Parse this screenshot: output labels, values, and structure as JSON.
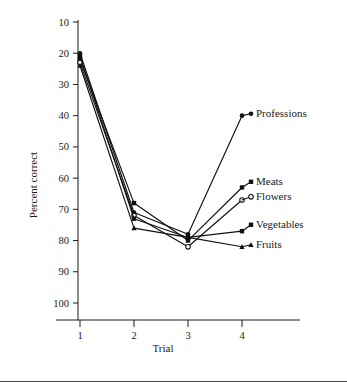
{
  "chart_data": {
    "type": "line",
    "title": "",
    "xlabel": "Trial",
    "ylabel": "Percent correct",
    "categories": [
      1,
      2,
      3,
      4
    ],
    "x": [
      1,
      2,
      3,
      4
    ],
    "xlim": [
      0.6,
      4.6
    ],
    "ylim": [
      4,
      103
    ],
    "yticks": [
      10,
      20,
      30,
      40,
      50,
      60,
      70,
      80,
      90,
      100
    ],
    "xticks": [
      1,
      2,
      3,
      4
    ],
    "grid": false,
    "legend_position": "right-inline-labels",
    "series": [
      {
        "name": "Professions",
        "marker": "filled-circle",
        "values": [
          90,
          39,
          32,
          70
        ]
      },
      {
        "name": "Meats",
        "marker": "filled-square",
        "values": [
          88,
          42,
          30,
          47
        ]
      },
      {
        "name": "Flowers",
        "marker": "open-circle",
        "values": [
          87,
          38,
          28,
          43
        ]
      },
      {
        "name": "Vegetables",
        "marker": "filled-square",
        "values": [
          89,
          37,
          31,
          33
        ]
      },
      {
        "name": "Fruits",
        "marker": "filled-triangle",
        "values": [
          86,
          34,
          31,
          28
        ]
      }
    ]
  },
  "axes": {
    "y_tick_labels": [
      "100",
      "90",
      "80",
      "70",
      "60",
      "50",
      "40",
      "30",
      "20",
      "10"
    ],
    "x_tick_labels": [
      "1",
      "2",
      "3",
      "4"
    ],
    "y_axis_title": "Percent correct",
    "x_axis_title": "Trial"
  },
  "series_labels": [
    {
      "text": "Professions"
    },
    {
      "text": "Meats"
    },
    {
      "text": "Flowers"
    },
    {
      "text": "Vegetables"
    },
    {
      "text": "Fruits"
    }
  ],
  "style": {
    "line_color": "#111111",
    "text_color": "#1a1a1a",
    "background": "#ffffff"
  }
}
